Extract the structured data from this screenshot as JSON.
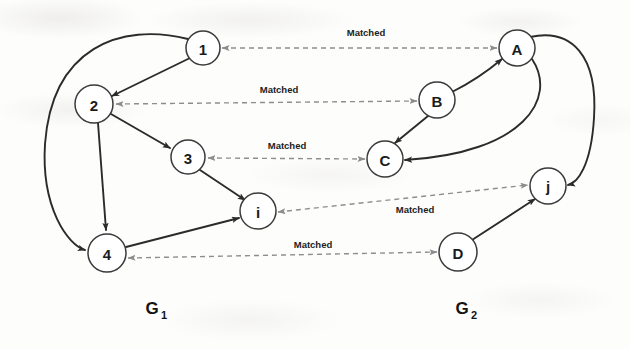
{
  "figure": {
    "background_color": "#fdfdfb",
    "solid_edge_color": "#2b2b2b",
    "dashed_edge_color": "#8d8d8d",
    "node_fill": "#ffffff",
    "node_stroke": "#3a3a3a"
  },
  "graphs": [
    {
      "id": "G1",
      "label": "G",
      "subscript": "1",
      "label_x": 152,
      "label_y": 314,
      "nodes": [
        {
          "id": "n1",
          "label": "1",
          "cx": 203,
          "cy": 48,
          "r": 17
        },
        {
          "id": "n2",
          "label": "2",
          "cx": 94,
          "cy": 104,
          "r": 19
        },
        {
          "id": "n3",
          "label": "3",
          "cx": 188,
          "cy": 157,
          "r": 17
        },
        {
          "id": "n4",
          "label": "4",
          "cx": 107,
          "cy": 253,
          "r": 19
        },
        {
          "id": "ni",
          "label": "i",
          "cx": 258,
          "cy": 211,
          "r": 18
        }
      ]
    },
    {
      "id": "G2",
      "label": "G",
      "subscript": "2",
      "label_x": 462,
      "label_y": 314,
      "nodes": [
        {
          "id": "nA",
          "label": "A",
          "cx": 517,
          "cy": 48,
          "r": 18
        },
        {
          "id": "nB",
          "label": "B",
          "cx": 437,
          "cy": 100,
          "r": 18
        },
        {
          "id": "nC",
          "label": "C",
          "cx": 385,
          "cy": 159,
          "r": 18
        },
        {
          "id": "nD",
          "label": "D",
          "cx": 458,
          "cy": 252,
          "r": 19
        },
        {
          "id": "nj",
          "label": "j",
          "cx": 548,
          "cy": 186,
          "r": 18
        }
      ]
    }
  ],
  "solid_edges": [
    {
      "name": "edge-1-to-2",
      "from": "n1",
      "to": "n2",
      "path": "M 190 58 L 110 95"
    },
    {
      "name": "edge-1-to-4",
      "from": "n1",
      "to": "n4",
      "path": "M 188 39 C 120 24 52 46 46 142 C 42 206 66 243 86 250"
    },
    {
      "name": "edge-2-to-3",
      "from": "n2",
      "to": "n3",
      "path": "M 111 114 L 172 149"
    },
    {
      "name": "edge-2-to-4",
      "from": "n2",
      "to": "n4",
      "path": "M 98 123 L 106 231"
    },
    {
      "name": "edge-3-to-i",
      "from": "n3",
      "to": "ni",
      "path": "M 199 169 L 245 200"
    },
    {
      "name": "edge-4-to-i",
      "from": "n4",
      "to": "ni",
      "path": "M 126 247 L 240 217"
    },
    {
      "name": "edge-B-to-A",
      "from": "nB",
      "to": "nA",
      "path": "M 452 93 C 475 82 488 70 501 58"
    },
    {
      "name": "edge-B-to-C",
      "from": "nB",
      "to": "nC",
      "path": "M 428 116 L 396 144"
    },
    {
      "name": "edge-A-to-C",
      "from": "nA",
      "to": "nC",
      "path": "M 531 58 C 556 96 525 152 404 159"
    },
    {
      "name": "edge-A-to-j",
      "from": "nA",
      "to": "nj",
      "path": "M 530 38 C 570 30 597 54 593 118 C 590 166 575 184 567 186"
    },
    {
      "name": "edge-D-to-j",
      "from": "nD",
      "to": "nj",
      "path": "M 472 240 L 536 198"
    }
  ],
  "matched_links": [
    {
      "name": "matched-1-A",
      "label": "Matched",
      "from": "n1",
      "to": "nA",
      "x1": 222,
      "y1": 48,
      "x2": 497,
      "y2": 48,
      "label_x": 366,
      "label_y": 36,
      "arrow_start": true,
      "arrow_end": true
    },
    {
      "name": "matched-2-B",
      "label": "Matched",
      "from": "n2",
      "to": "nB",
      "x1": 116,
      "y1": 104,
      "x2": 417,
      "y2": 101,
      "label_x": 279,
      "label_y": 93,
      "arrow_start": true,
      "arrow_end": true
    },
    {
      "name": "matched-3-C",
      "label": "Matched",
      "from": "n3",
      "to": "nC",
      "x1": 208,
      "y1": 158,
      "x2": 365,
      "y2": 159,
      "label_x": 287,
      "label_y": 149,
      "arrow_start": true,
      "arrow_end": true
    },
    {
      "name": "matched-i-j",
      "label": "Matched",
      "from": "ni",
      "to": "nj",
      "x1": 278,
      "y1": 212,
      "x2": 528,
      "y2": 185,
      "label_x": 415,
      "label_y": 213,
      "arrow_start": true,
      "arrow_end": true
    },
    {
      "name": "matched-4-D",
      "label": "Matched",
      "from": "n4",
      "to": "nD",
      "x1": 128,
      "y1": 258,
      "x2": 437,
      "y2": 252,
      "label_x": 313,
      "label_y": 248,
      "arrow_start": true,
      "arrow_end": true
    }
  ]
}
